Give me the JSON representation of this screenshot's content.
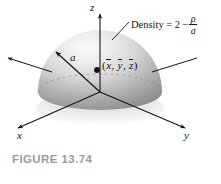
{
  "figure": {
    "caption": "FIGURE 13.74",
    "caption_color": "#9a9a9a",
    "background_color": "#ffffff",
    "ink_color": "#141414"
  },
  "axes": {
    "z_label": "z",
    "x_label": "x",
    "y_label": "y"
  },
  "annotations": {
    "radius_label": "a",
    "centroid_open": "(",
    "centroid_x": "x",
    "centroid_comma1": ",",
    "centroid_y": "y",
    "centroid_comma2": ",",
    "centroid_z": "z",
    "centroid_close": ")",
    "density_name": "Density",
    "density_equals": "=",
    "density_value": "2",
    "density_minus": "−",
    "density_numerator": "ρ",
    "density_denominator": "a"
  },
  "solid": {
    "shape_name": "hemisphere",
    "surface_light": "#f4f4f4",
    "surface_mid": "#c9c9c9",
    "surface_dark": "#8e8e8e"
  }
}
